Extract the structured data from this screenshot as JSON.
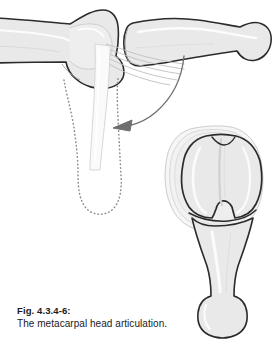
{
  "figure": {
    "caption_label": "Fig. 4.3.4-6:",
    "caption_text": "The metacarpal head articulation.",
    "alt_summary": "Lateral view of metacarpophalangeal joint with collateral ligament and flexed phalanx in dotted outline, plus distal end-on view of the metacarpal head condyles.",
    "colors": {
      "background": "#ffffff",
      "bone_fill": "#e9e9e9",
      "bone_fill_light": "#f2f2f2",
      "bone_outline": "#2b2b2b",
      "cartilage_outline": "#bdbdbd",
      "highlight": "#fbfbfb",
      "dotted_outline": "#8c8c8c",
      "arrow": "#6e6e6e",
      "caption_text": "#1a1a1a"
    },
    "parts": [
      {
        "name": "metacarpal-shaft-lateral",
        "label": "Metacarpal shaft, lateral view",
        "view": "lateral"
      },
      {
        "name": "metacarpal-head-lateral",
        "label": "Metacarpal head, lateral view",
        "view": "lateral"
      },
      {
        "name": "proximal-phalanx-extended",
        "label": "Proximal phalanx in extension",
        "view": "lateral"
      },
      {
        "name": "collateral-ligament-fibers",
        "label": "Collateral ligament fiber bundle",
        "view": "lateral"
      },
      {
        "name": "proximal-phalanx-flexed-outline",
        "label": "Proximal phalanx in flexion (dotted)",
        "view": "lateral"
      },
      {
        "name": "flexion-arrow",
        "label": "Direction of flexion",
        "view": "lateral"
      },
      {
        "name": "metacarpal-head-distal",
        "label": "Metacarpal head, distal end-on view",
        "view": "distal"
      },
      {
        "name": "metacarpal-condyle-medial",
        "label": "Medial condyle",
        "view": "distal"
      },
      {
        "name": "metacarpal-condyle-lateral",
        "label": "Lateral condyle",
        "view": "distal"
      },
      {
        "name": "metacarpal-shaft-distal",
        "label": "Metacarpal shaft, distal view",
        "view": "distal"
      }
    ]
  }
}
